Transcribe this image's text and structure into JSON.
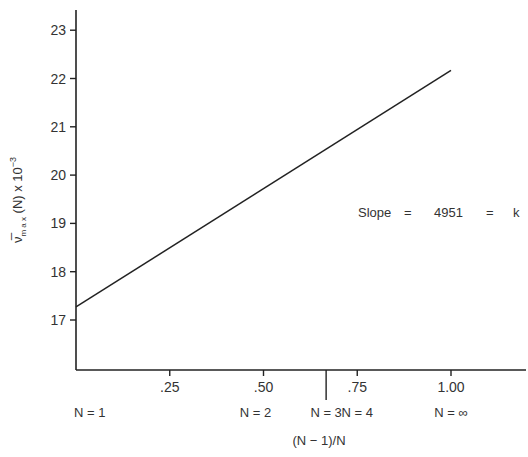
{
  "chart_data": {
    "type": "line",
    "title": "",
    "xlabel": "(N − 1)/N",
    "ylabel": "ν̅max (N) x 10⁻³",
    "ylabel_parts": {
      "symbol": "ν̅",
      "sub": "m a x",
      "rest": " (N) x 10",
      "sup": "−3"
    },
    "xlim": [
      0,
      1.2
    ],
    "ylim": [
      16,
      23.4
    ],
    "x_ticks": [
      {
        "value": 0.25,
        "label": ".25"
      },
      {
        "value": 0.5,
        "label": ".50"
      },
      {
        "value": 0.667,
        "label": ""
      },
      {
        "value": 0.75,
        "label": ".75"
      },
      {
        "value": 1.0,
        "label": "1.00"
      }
    ],
    "y_ticks": [
      17,
      18,
      19,
      20,
      21,
      22,
      23
    ],
    "n_labels": [
      {
        "value": 0.0,
        "label": "N = 1"
      },
      {
        "value": 0.5,
        "label": "N = 2"
      },
      {
        "value": 0.667,
        "label": "N = 3"
      },
      {
        "value": 0.75,
        "label": "N = 4"
      },
      {
        "value": 1.0,
        "label": "N = ∞"
      }
    ],
    "series": [
      {
        "name": "fit",
        "x": [
          0.0,
          1.0
        ],
        "y": [
          17.27,
          22.17
        ]
      }
    ],
    "annotation": {
      "slope_label": "Slope",
      "eq1": "=",
      "value": "4951",
      "eq2": "=",
      "k": "k"
    },
    "grid": false,
    "legend": null
  }
}
